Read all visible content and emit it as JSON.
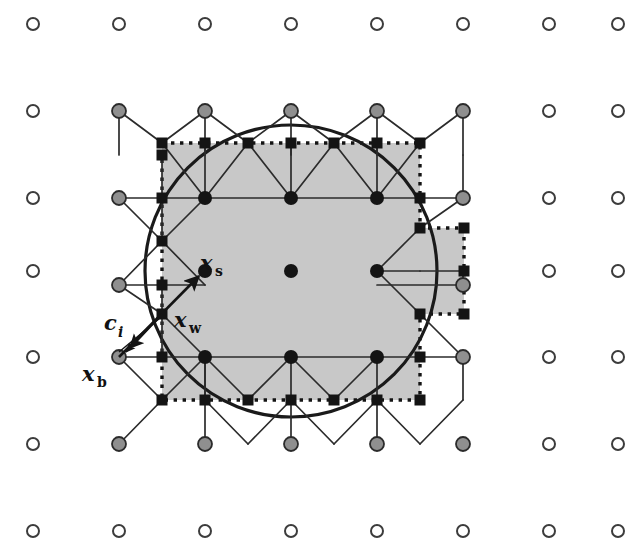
{
  "figure": {
    "domain_type": "diagram",
    "canvas": {
      "width": 636,
      "height": 560,
      "background": "#ffffff"
    }
  },
  "colors": {
    "solid_fill": "#c8c8c8",
    "stroke": "#1a1a1a",
    "open_node_fill": "#ffffff",
    "open_node_stroke": "#3c3c3c",
    "grey_node_fill": "#8f8f8f",
    "grey_node_stroke": "#2b2b2b",
    "black_node_fill": "#141414",
    "square_node_fill": "#141414",
    "circle_curve": "#1a1a1a",
    "dotted_boundary": "#141414"
  },
  "lattice": {
    "origin_x": 33,
    "origin_y": 24,
    "spacing_x": 86,
    "spacing_y": 87,
    "cols": 8,
    "rows": 7,
    "description": "Regular Cartesian grid of primary nodes; square markers sit at half-spacing midpoints."
  },
  "labels": [
    {
      "id": "x-s",
      "base": "x",
      "sub": "s",
      "sub_italic": false,
      "x": 205,
      "y": 262,
      "anchor_x": 205,
      "anchor_y": 270,
      "meaning": "solid-node position"
    },
    {
      "id": "x-w",
      "base": "x",
      "sub": "w",
      "sub_italic": false,
      "x": 176,
      "y": 322,
      "anchor_x": 162,
      "anchor_y": 314,
      "meaning": "wall / boundary intersection point"
    },
    {
      "id": "c-i",
      "base": "c",
      "sub": "i",
      "sub_italic": true,
      "x": 105,
      "y": 327,
      "anchor_x": 140,
      "anchor_y": 340,
      "meaning": "lattice velocity direction vector"
    },
    {
      "id": "x-b",
      "base": "x",
      "sub": "b",
      "sub_italic": false,
      "x": 83,
      "y": 382,
      "anchor_x": 119,
      "anchor_y": 357,
      "meaning": "fluid (boundary) node position"
    }
  ],
  "markers": {
    "open_circle": {
      "name": "open-node",
      "radius": 6,
      "legend": "far-field fluid node"
    },
    "grey_circle": {
      "name": "grey-node",
      "radius": 7,
      "legend": "near-boundary fluid node"
    },
    "black_circle": {
      "name": "black-node",
      "radius": 7,
      "legend": "interior solid node"
    },
    "black_square": {
      "name": "square-node",
      "size": 11,
      "legend": "staggered midpoint node"
    }
  },
  "shapes": {
    "circle_boundary": {
      "name": "physical-circular-boundary",
      "cx": 291,
      "cy": 271,
      "r": 146,
      "stroke_width": 3.2
    },
    "solid_region": {
      "name": "discretized-solid-region",
      "fill": "#c8c8c8",
      "dotted_outline": true,
      "note": "Staircase polygon approximating the circle, with a square protrusion on the right."
    }
  },
  "annotations": {
    "arrow_xw_to_xs": {
      "name": "arrow-xw-to-xs",
      "from": [
        119,
        357
      ],
      "to": [
        205,
        270
      ]
    },
    "arrow_xw_to_xb": {
      "name": "arrow-xw-to-xb",
      "from": [
        162,
        314
      ],
      "to": [
        119,
        357
      ]
    },
    "arrow_ci": {
      "name": "arrow-ci",
      "from": [
        162,
        314
      ],
      "to": [
        122,
        356
      ]
    }
  }
}
